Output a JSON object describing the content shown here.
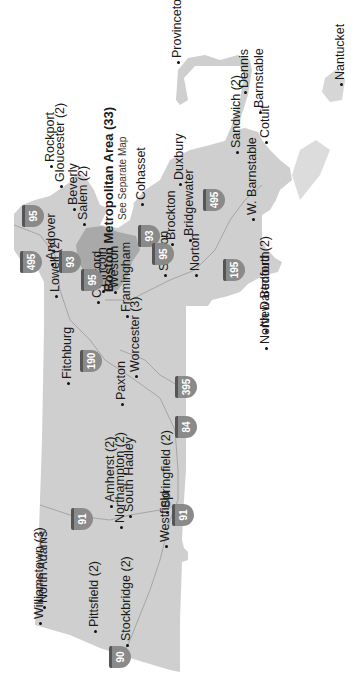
{
  "map": {
    "title": "Massachusetts locations",
    "orientation": "rotated -90deg",
    "colors": {
      "land": "#cfcfcf",
      "boston_metro": "#a9a9a9",
      "roads": "#9a9a9a",
      "shield": "#8a8a8a",
      "text": "#1a1a1a",
      "background": "#ffffff"
    },
    "cities": [
      {
        "name": "Provincetown",
        "x": 178,
        "y": 58
      },
      {
        "name": "Nantucket",
        "x": 341,
        "y": 80
      },
      {
        "name": "Dennis",
        "x": 245,
        "y": 88
      },
      {
        "name": "Barnstable",
        "x": 260,
        "y": 108
      },
      {
        "name": "Rockport",
        "x": 51,
        "y": 162
      },
      {
        "name": "Gloucester (2)",
        "x": 61,
        "y": 182
      },
      {
        "name": "Beverly",
        "x": 74,
        "y": 205
      },
      {
        "name": "Salem (2)",
        "x": 84,
        "y": 220
      },
      {
        "name": "Cohasset",
        "x": 142,
        "y": 200
      },
      {
        "name": "Duxbury",
        "x": 180,
        "y": 180
      },
      {
        "name": "Bridgewater",
        "x": 190,
        "y": 236
      },
      {
        "name": "Brockton",
        "x": 172,
        "y": 240
      },
      {
        "name": "Sandwich (2)",
        "x": 237,
        "y": 148
      },
      {
        "name": "W. Barnstable",
        "x": 253,
        "y": 215
      },
      {
        "name": "Cotuit",
        "x": 266,
        "y": 138
      },
      {
        "name": "Andover",
        "x": 52,
        "y": 260
      },
      {
        "name": "Lowell (2)",
        "x": 56,
        "y": 292
      },
      {
        "name": "Concord",
        "x": 98,
        "y": 298
      },
      {
        "name": "Lincoln",
        "x": 103,
        "y": 287
      },
      {
        "name": "Weston",
        "x": 115,
        "y": 288
      },
      {
        "name": "Framingham",
        "x": 127,
        "y": 312
      },
      {
        "name": "Worcester (3)",
        "x": 136,
        "y": 372
      },
      {
        "name": "Sharon",
        "x": 165,
        "y": 271
      },
      {
        "name": "Norton",
        "x": 196,
        "y": 271
      },
      {
        "name": "New Bedford (2)",
        "x": 266,
        "y": 327
      },
      {
        "name": "North Dartmouth",
        "x": 266,
        "y": 344
      },
      {
        "name": "Fitchburg",
        "x": 68,
        "y": 379
      },
      {
        "name": "Paxton",
        "x": 122,
        "y": 400
      },
      {
        "name": "Amherst (2)",
        "x": 111,
        "y": 502
      },
      {
        "name": "South Hadley",
        "x": 130,
        "y": 512
      },
      {
        "name": "Springfield (2)",
        "x": 167,
        "y": 508
      },
      {
        "name": "Williamstown (3)",
        "x": 40,
        "y": 619
      },
      {
        "name": "North Adams",
        "x": 44,
        "y": 603
      },
      {
        "name": "Pittsfield (2)",
        "x": 95,
        "y": 627
      },
      {
        "name": "Northampton (2)",
        "x": 121,
        "y": 523
      },
      {
        "name": "Stockbridge (2)",
        "x": 127,
        "y": 641
      },
      {
        "name": "Westfield",
        "x": 166,
        "y": 542
      }
    ],
    "boston": {
      "label": "Boston Metropolitan Area (33)",
      "sublabel": "See Separate Map"
    },
    "highways": [
      {
        "num": "95",
        "x": 33,
        "y": 216
      },
      {
        "num": "495",
        "x": 31,
        "y": 262
      },
      {
        "num": "93",
        "x": 70,
        "y": 262
      },
      {
        "num": "95",
        "x": 92,
        "y": 280
      },
      {
        "num": "93",
        "x": 149,
        "y": 236
      },
      {
        "num": "95",
        "x": 163,
        "y": 254
      },
      {
        "num": "495",
        "x": 214,
        "y": 200
      },
      {
        "name": "",
        "num": "195",
        "x": 234,
        "y": 270
      },
      {
        "num": "190",
        "x": 91,
        "y": 361
      },
      {
        "num": "395",
        "x": 186,
        "y": 387
      },
      {
        "num": "84",
        "x": 186,
        "y": 427
      },
      {
        "num": "91",
        "x": 82,
        "y": 519
      },
      {
        "num": "91",
        "x": 183,
        "y": 515
      },
      {
        "num": "90",
        "x": 120,
        "y": 657
      }
    ]
  }
}
